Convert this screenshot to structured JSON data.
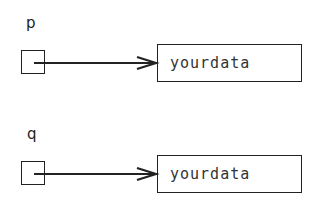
{
  "diagram": {
    "pointers": [
      {
        "name": "p",
        "target_label": "yourdata"
      },
      {
        "name": "q",
        "target_label": "yourdata"
      }
    ]
  }
}
